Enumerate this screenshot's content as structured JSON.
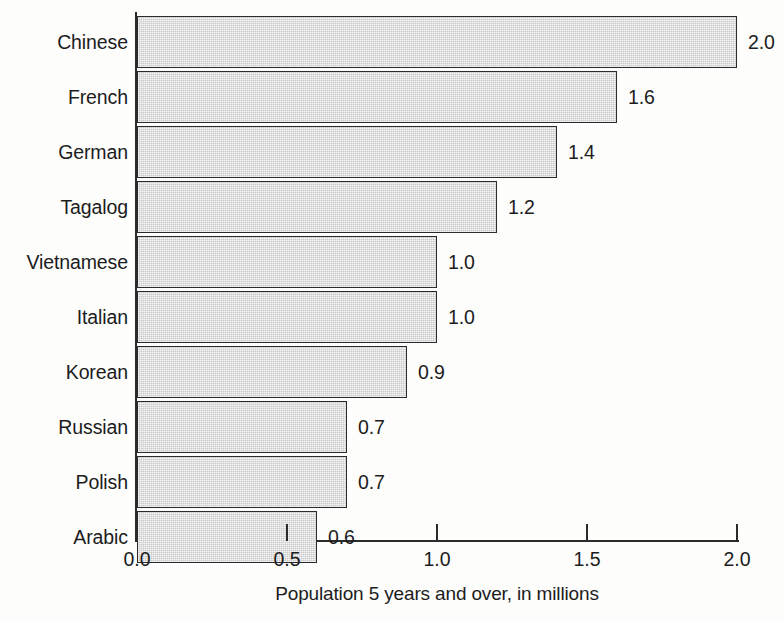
{
  "chart_data": {
    "type": "bar",
    "orientation": "horizontal",
    "title": "",
    "xlabel": "Population 5 years and over, in millions",
    "ylabel": "",
    "categories": [
      "Chinese",
      "French",
      "German",
      "Tagalog",
      "Vietnamese",
      "Italian",
      "Korean",
      "Russian",
      "Polish",
      "Arabic"
    ],
    "values": [
      2.0,
      1.6,
      1.4,
      1.2,
      1.0,
      1.0,
      0.9,
      0.7,
      0.7,
      0.6
    ],
    "value_labels": [
      "2.0",
      "1.6",
      "1.4",
      "1.2",
      "1.0",
      "1.0",
      "0.9",
      "0.7",
      "0.7",
      "0.6"
    ],
    "xlim": [
      0.0,
      2.0
    ],
    "xticks": [
      0.0,
      0.5,
      1.0,
      1.5,
      2.0
    ],
    "xtick_labels": [
      "0.0",
      "0.5",
      "1.0",
      "1.5",
      "2.0"
    ],
    "grid": false,
    "legend": null,
    "bar_fill_color": "#c9c9c9",
    "bar_edge_color": "#2b2b2b",
    "background_color": "#fdfdfc"
  }
}
